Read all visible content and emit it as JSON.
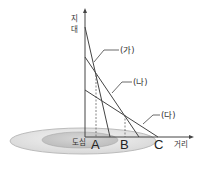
{
  "diagram": {
    "type": "bid-rent-curve",
    "y_axis_label": [
      "지",
      "대"
    ],
    "x_axis_label": "거리",
    "origin_label": "도심",
    "curves": [
      {
        "label": "(가)",
        "from": [
          85,
          27
        ],
        "to": [
          110,
          137
        ]
      },
      {
        "label": "(나)",
        "from": [
          85,
          57
        ],
        "to": [
          139,
          137
        ]
      },
      {
        "label": "(다)",
        "from": [
          85,
          90
        ],
        "to": [
          158,
          137
        ]
      }
    ],
    "points": [
      {
        "label": "A"
      },
      {
        "label": "B"
      },
      {
        "label": "C"
      }
    ],
    "colors": {
      "line": "#444444",
      "outer_zone": "#e6e6e6",
      "inner_zone": "#c8c8c8"
    }
  }
}
